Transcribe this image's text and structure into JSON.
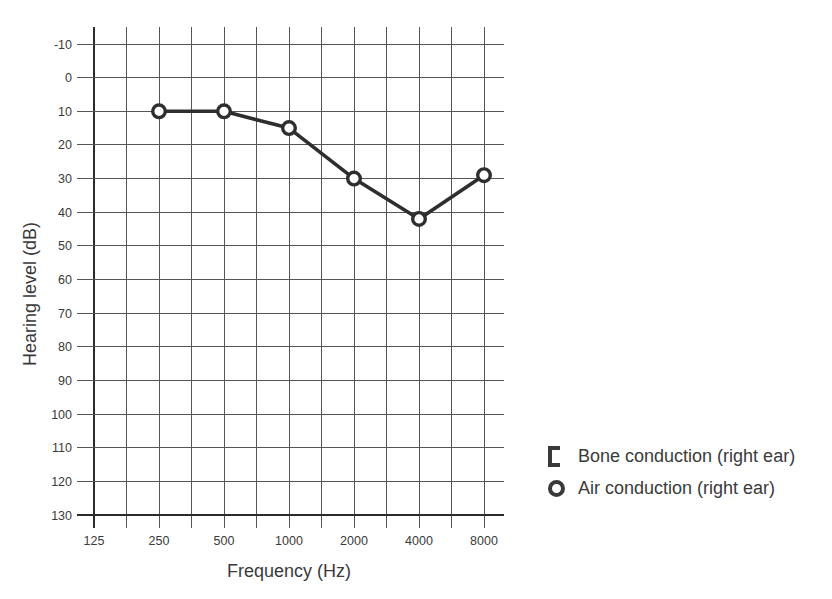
{
  "chart_data": {
    "type": "line",
    "title": "",
    "xlabel": "Frequency (Hz)",
    "ylabel": "Hearing level (dB)",
    "x_scale": "log2",
    "xlim": [
      125,
      8000
    ],
    "x_ticks": [
      125,
      250,
      500,
      1000,
      2000,
      4000,
      8000
    ],
    "x_minor_gridlines": "half-octave",
    "ylim": [
      -10,
      130
    ],
    "y_ticks": [
      -10,
      0,
      10,
      20,
      30,
      40,
      50,
      60,
      70,
      80,
      90,
      100,
      110,
      120,
      130
    ],
    "y_increases_downward": true,
    "grid": true,
    "series": [
      {
        "name": "Air conduction (right ear)",
        "marker": "open-circle",
        "x": [
          250,
          500,
          1000,
          2000,
          4000,
          8000
        ],
        "y": [
          10,
          10,
          15,
          30,
          42,
          29
        ]
      },
      {
        "name": "Bone conduction (right ear)",
        "marker": "left-bracket",
        "x": [],
        "y": []
      }
    ],
    "legend": {
      "position": "right-middle",
      "entries": [
        {
          "symbol": "left-bracket",
          "label": "Bone conduction (right ear)"
        },
        {
          "symbol": "open-circle",
          "label": "Air conduction (right ear)"
        }
      ]
    },
    "colors": {
      "line": "#2e2e2e",
      "marker_stroke": "#2e2e2e",
      "marker_fill": "#ffffff",
      "grid_thin": "#555555",
      "grid_thick": "#2b2b2b",
      "text": "#3a3a3a"
    }
  }
}
